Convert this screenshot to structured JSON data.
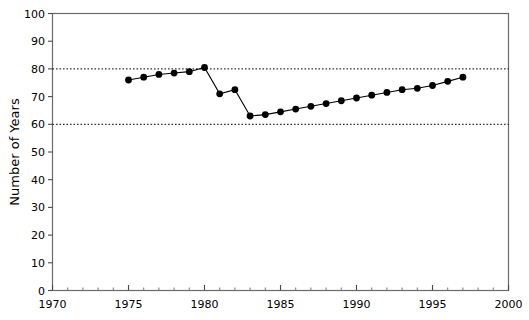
{
  "chart_data": {
    "type": "line",
    "title": "",
    "subtitle": "",
    "xlabel": "",
    "ylabel": "Number of Years",
    "xlim": [
      1970,
      2000
    ],
    "ylim": [
      0,
      100
    ],
    "xticks": [
      1970,
      1975,
      1980,
      1985,
      1990,
      1995,
      2000
    ],
    "yticks": [
      0,
      10,
      20,
      30,
      40,
      50,
      60,
      70,
      80,
      90,
      100
    ],
    "xtick_labels": [
      "1970",
      "1975",
      "1980",
      "1985",
      "1990",
      "1995",
      "2000"
    ],
    "ytick_labels": [
      "0",
      "10",
      "20",
      "30",
      "40",
      "50",
      "60",
      "70",
      "80",
      "90",
      "100"
    ],
    "x_minor_tick_interval": 1,
    "grid": false,
    "legend": null,
    "marker": "filled-circle",
    "line_color": "#000000",
    "marker_color": "#000000",
    "reference_lines": [
      {
        "value": 80,
        "style": "dotted",
        "color": "#000000"
      },
      {
        "value": 60,
        "style": "dotted",
        "color": "#000000"
      }
    ],
    "x": [
      1975,
      1976,
      1977,
      1978,
      1979,
      1980,
      1981,
      1982,
      1983,
      1984,
      1985,
      1986,
      1987,
      1988,
      1989,
      1990,
      1991,
      1992,
      1993,
      1994,
      1995,
      1996,
      1997
    ],
    "values": [
      76,
      77,
      78,
      78.5,
      79,
      80.5,
      71,
      72.5,
      63,
      63.5,
      64.5,
      65.5,
      66.5,
      67.5,
      68.5,
      69.5,
      70.5,
      71.5,
      72.5,
      73,
      74,
      75.5,
      77
    ],
    "series": [
      {
        "name": "Number of Years",
        "x": [
          1975,
          1976,
          1977,
          1978,
          1979,
          1980,
          1981,
          1982,
          1983,
          1984,
          1985,
          1986,
          1987,
          1988,
          1989,
          1990,
          1991,
          1992,
          1993,
          1994,
          1995,
          1996,
          1997
        ],
        "values": [
          76,
          77,
          78,
          78.5,
          79,
          80.5,
          71,
          72.5,
          63,
          63.5,
          64.5,
          65.5,
          66.5,
          67.5,
          68.5,
          69.5,
          70.5,
          71.5,
          72.5,
          73,
          74,
          75.5,
          77
        ]
      }
    ]
  }
}
